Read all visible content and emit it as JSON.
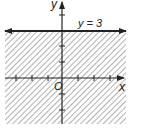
{
  "diagram": {
    "type": "inequality-graph",
    "inequality": "y < 3",
    "boundary_line": {
      "equation": "y = 3",
      "label": "y = 3",
      "style": "solid"
    },
    "shaded_region": "below boundary line",
    "axes": {
      "x_label": "x",
      "y_label": "y",
      "origin_label": "O",
      "x_ticks": [
        -3,
        -2,
        -1,
        1,
        2,
        3
      ],
      "y_ticks": [
        -2,
        -1,
        1,
        2,
        4
      ]
    },
    "colors": {
      "line": "#222222",
      "hatch": "#9a9a9a",
      "background": "#ffffff"
    }
  }
}
